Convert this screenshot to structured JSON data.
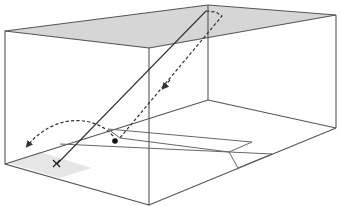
{
  "diagram": {
    "type": "3d-court-trajectory",
    "colors": {
      "background": "#ffffff",
      "edges": "#555555",
      "ceiling_fill": "#d6d6d6",
      "floor_shadow": "#e6e6e6",
      "trajectory": "#333333"
    },
    "elements": {
      "box": "rectangular court (3D perspective)",
      "ceiling": "shaded ceiling plane",
      "floor_markings": "service lines on floor",
      "shadow_patch": "shaded area on floor around launch point",
      "launch_point": "x-mark",
      "solid_trajectory": "straight line from launch point up to ceiling",
      "bounce_trajectory": "dashed line from ceiling down to floor",
      "bounce_point": "black dot",
      "rebound_arc": "dashed arc with arrowhead"
    }
  }
}
